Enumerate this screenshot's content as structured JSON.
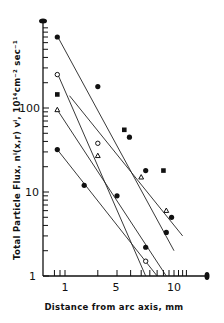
{
  "chart_data": {
    "type": "scatter",
    "title": "",
    "xlabel": "Distance from arc axis, mm",
    "ylabel": "Total Particle Flux, n_i(x,r) v_i, 10^14 cm^-2 sec^-1",
    "xscale": "log",
    "yscale": "log",
    "xlim": [
      0.7,
      14
    ],
    "ylim": [
      1,
      1000
    ],
    "x_tick_labels": [
      "1",
      "5",
      "10"
    ],
    "y_tick_labels": [
      "1",
      "10",
      "100"
    ],
    "grid": false,
    "legend": null,
    "series": [
      {
        "name": "filled circles (upper)",
        "marker": "filled-circle",
        "points": [
          [
            0.85,
            700
          ],
          [
            2.0,
            180
          ],
          [
            5.5,
            18
          ],
          [
            9.5,
            5
          ]
        ],
        "fit_line": [
          [
            0.85,
            720
          ],
          [
            10.0,
            2.0
          ]
        ]
      },
      {
        "name": "open circles",
        "marker": "open-circle",
        "points": [
          [
            0.85,
            250
          ],
          [
            2.0,
            38
          ],
          [
            5.5,
            1.5
          ]
        ],
        "fit_line": [
          [
            0.85,
            260
          ],
          [
            5.5,
            1.0
          ]
        ]
      },
      {
        "name": "filled squares",
        "marker": "filled-square",
        "points": [
          [
            0.85,
            145
          ],
          [
            3.5,
            55
          ],
          [
            8.0,
            18
          ]
        ],
        "fit_line": [
          [
            1.1,
            140
          ],
          [
            12.0,
            3.0
          ]
        ]
      },
      {
        "name": "triangles",
        "marker": "triangle",
        "points": [
          [
            0.85,
            95
          ],
          [
            2.0,
            27
          ],
          [
            5.0,
            15
          ],
          [
            8.5,
            6
          ]
        ],
        "fit_line": [
          [
            0.85,
            95
          ],
          [
            8.5,
            1.0
          ]
        ]
      },
      {
        "name": "filled circles (lower)",
        "marker": "filled-circle",
        "points": [
          [
            0.85,
            32
          ],
          [
            1.5,
            12
          ],
          [
            3.0,
            9
          ],
          [
            5.5,
            2.2
          ],
          [
            8.5,
            3.3
          ],
          [
            3.9,
            45
          ]
        ],
        "fit_line": [
          [
            0.85,
            32
          ],
          [
            7.0,
            1.0
          ]
        ]
      }
    ]
  },
  "axes": {
    "x_title": "Distance from arc axis, mm",
    "y_title": "Total Particle Flux, nⁱ(x,r) vⁱ, 10¹⁴cm⁻² sec⁻¹",
    "y_labels": {
      "one": "1",
      "ten": "10",
      "hundred": "100"
    },
    "x_labels": {
      "one": "1",
      "five": "5",
      "ten": "10"
    }
  }
}
